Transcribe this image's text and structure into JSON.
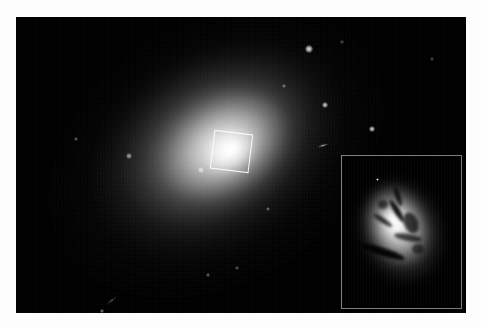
{
  "image": {
    "domain": "astronomical-photograph",
    "background_color": "#fdfdfd",
    "frame_color": "#000000",
    "caption": "",
    "alt_text": "Elliptical galaxy with bright diffuse halo and a boxed nuclear region, shown enlarged in a lower-right inset revealing dark dust lanes"
  },
  "main_frame": {
    "x": 16,
    "y": 17,
    "width": 450,
    "height": 296,
    "sky_color": "#000000",
    "galaxy": {
      "name": "",
      "type": "elliptical",
      "center_x": 212,
      "center_y": 134,
      "position_angle_deg": -32,
      "halo_major_px": 420,
      "halo_minor_px": 300,
      "core_color": "#ffffff",
      "halo_color": "#b4b4b4"
    },
    "marker_box": {
      "label": "",
      "x": 196,
      "y": 115,
      "size": 39,
      "rotation_deg": 7,
      "stroke_color": "#ffffff",
      "stroke_width": 1.2
    },
    "point_sources": [
      {
        "name": "star-1",
        "x": 293,
        "y": 32,
        "r": 2.4,
        "brightness": 0.95
      },
      {
        "name": "star-2",
        "x": 309,
        "y": 88,
        "r": 2.0,
        "brightness": 0.85
      },
      {
        "name": "star-3",
        "x": 356,
        "y": 112,
        "r": 2.1,
        "brightness": 0.88
      },
      {
        "name": "star-4",
        "x": 113,
        "y": 139,
        "r": 1.6,
        "brightness": 0.62
      },
      {
        "name": "star-5",
        "x": 185,
        "y": 153,
        "r": 1.8,
        "brightness": 0.7
      },
      {
        "name": "star-6",
        "x": 268,
        "y": 69,
        "r": 1.3,
        "brightness": 0.5
      },
      {
        "name": "star-7",
        "x": 60,
        "y": 122,
        "r": 1.1,
        "brightness": 0.42
      },
      {
        "name": "star-8",
        "x": 252,
        "y": 192,
        "r": 1.2,
        "brightness": 0.45
      },
      {
        "name": "star-9",
        "x": 86,
        "y": 294,
        "r": 1.5,
        "brightness": 0.55
      },
      {
        "name": "star-10",
        "x": 192,
        "y": 258,
        "r": 1.2,
        "brightness": 0.45
      },
      {
        "name": "star-11",
        "x": 221,
        "y": 251,
        "r": 1.1,
        "brightness": 0.4
      },
      {
        "name": "star-12",
        "x": 326,
        "y": 25,
        "r": 1.0,
        "brightness": 0.35
      },
      {
        "name": "star-13",
        "x": 416,
        "y": 42,
        "r": 1.0,
        "brightness": 0.32
      }
    ],
    "extended_sources": [
      {
        "name": "edge-on-galaxy",
        "x": 307,
        "y": 129,
        "w": 14,
        "h": 3.4,
        "angle_deg": -16,
        "brightness": 0.8
      },
      {
        "name": "faint-streak",
        "x": 95,
        "y": 283,
        "w": 17,
        "h": 2.6,
        "angle_deg": -38,
        "brightness": 0.4
      }
    ]
  },
  "inset_panel": {
    "label": "",
    "x": 325,
    "y": 138,
    "width": 121,
    "height": 154,
    "border_color": "#7f7f7f",
    "border_width": 1.1,
    "background": "#000000",
    "content_description": "magnified nuclear region showing dusty absorption lanes against a bright stellar core",
    "nucleus": {
      "center_x": 55,
      "center_y": 70,
      "position_angle_deg": -18,
      "peak_color": "#ffffff"
    },
    "dust_lanes": [
      {
        "name": "dust-lane-central",
        "x": 42,
        "y": 52,
        "w": 26,
        "h": 6,
        "angle_deg": 58,
        "opacity": 0.92
      },
      {
        "name": "dust-lane-upper",
        "x": 46,
        "y": 38,
        "w": 20,
        "h": 5,
        "angle_deg": 72,
        "opacity": 0.82
      },
      {
        "name": "dust-lane-left",
        "x": 30,
        "y": 62,
        "w": 22,
        "h": 5,
        "angle_deg": 34,
        "opacity": 0.78
      },
      {
        "name": "dust-lane-lower",
        "x": 18,
        "y": 92,
        "w": 46,
        "h": 8,
        "angle_deg": 18,
        "opacity": 0.95
      },
      {
        "name": "dust-lane-right",
        "x": 62,
        "y": 56,
        "w": 14,
        "h": 22,
        "angle_deg": -22,
        "opacity": 0.72
      },
      {
        "name": "dust-lane-arc",
        "x": 52,
        "y": 78,
        "w": 28,
        "h": 7,
        "angle_deg": 10,
        "opacity": 0.7
      },
      {
        "name": "dust-patch-nw",
        "x": 36,
        "y": 44,
        "w": 10,
        "h": 9,
        "angle_deg": 0,
        "opacity": 0.6
      },
      {
        "name": "dust-patch-se",
        "x": 70,
        "y": 88,
        "w": 12,
        "h": 10,
        "angle_deg": 0,
        "opacity": 0.55
      }
    ],
    "point_sources": [
      {
        "name": "inset-star-1",
        "x": 34,
        "y": 22,
        "r": 1.5,
        "brightness": 0.9
      }
    ]
  }
}
